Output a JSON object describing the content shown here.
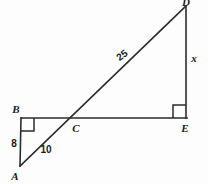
{
  "figure": {
    "background_color": "#fdfdfd",
    "stroke_color": "#2b2b2b",
    "text_color": "#1a1a1a",
    "vertices": [
      {
        "id": "A",
        "label": "A",
        "x": 20,
        "y": 166
      },
      {
        "id": "B",
        "label": "B",
        "x": 21,
        "y": 118
      },
      {
        "id": "C",
        "label": "C",
        "x": 70,
        "y": 118
      },
      {
        "id": "D",
        "label": "D",
        "x": 186,
        "y": 6
      },
      {
        "id": "E",
        "label": "E",
        "x": 186,
        "y": 118
      }
    ],
    "segments": [
      {
        "id": "AB",
        "from": "A",
        "to": "B",
        "measure": "8"
      },
      {
        "id": "BE",
        "from": "B",
        "to": "E",
        "measure": ""
      },
      {
        "id": "AD",
        "from": "A",
        "to": "D",
        "measure": ""
      },
      {
        "id": "DE",
        "from": "D",
        "to": "E",
        "measure": "x"
      }
    ],
    "length_labels": [
      {
        "id": "AB-length",
        "text": "8",
        "x": 14,
        "y": 145,
        "rotation": 0
      },
      {
        "id": "AC-length",
        "text": "10",
        "x": 44,
        "y": 152,
        "rotation": 0
      },
      {
        "id": "CD-length",
        "text": "25",
        "x": 124,
        "y": 58,
        "rotation": -36
      },
      {
        "id": "DE-length",
        "text": "x",
        "x": 191,
        "y": 60,
        "rotation": 0
      }
    ],
    "right_angles": [
      {
        "id": "right-angle-B",
        "at": "B",
        "x": 21,
        "y": 118,
        "size": 13,
        "dir_x": 1,
        "dir_y": 1
      },
      {
        "id": "right-angle-E",
        "at": "E",
        "x": 186,
        "y": 118,
        "size": 13,
        "dir_x": -1,
        "dir_y": -1
      }
    ],
    "vertex_label_positions": [
      {
        "id": "label-A",
        "text": "A",
        "x": 15,
        "y": 180
      },
      {
        "id": "label-B",
        "text": "B",
        "x": 16,
        "y": 113
      },
      {
        "id": "label-C",
        "text": "C",
        "x": 72,
        "y": 131
      },
      {
        "id": "label-D",
        "text": "D",
        "x": 182,
        "y": 4
      },
      {
        "id": "label-E",
        "text": "E",
        "x": 181,
        "y": 131
      }
    ]
  }
}
